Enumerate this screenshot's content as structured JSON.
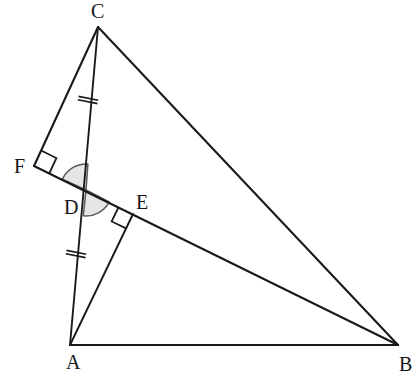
{
  "figure": {
    "kind": "geometry-diagram",
    "background_color": "#ffffff",
    "stroke_color": "#1a1a1a",
    "arc_fill_color": "#e6e6e6",
    "arc_stroke_color": "#5a5a5a",
    "width": 414,
    "height": 378
  },
  "points": {
    "A": {
      "label": "A",
      "x": 70,
      "y": 345,
      "label_x": 66,
      "label_y": 369
    },
    "B": {
      "label": "B",
      "x": 398,
      "y": 345,
      "label_x": 399,
      "label_y": 371
    },
    "C": {
      "label": "C",
      "x": 98,
      "y": 27,
      "label_x": 91,
      "label_y": 18
    },
    "D": {
      "label": "D",
      "x": 86,
      "y": 190,
      "label_x": 64,
      "label_y": 214
    },
    "E": {
      "label": "E",
      "x": 133,
      "y": 214,
      "label_x": 136,
      "label_y": 209
    },
    "F": {
      "label": "F",
      "x": 34,
      "y": 166,
      "label_x": 14,
      "label_y": 173
    }
  },
  "segments": [
    {
      "name": "AB",
      "from": "A",
      "to": "B"
    },
    {
      "name": "CB",
      "from": "C",
      "to": "B"
    },
    {
      "name": "CF",
      "from": "C",
      "to": "F"
    },
    {
      "name": "CA",
      "from": "C",
      "to": "A"
    },
    {
      "name": "FB",
      "from": "F",
      "to": "B"
    },
    {
      "name": "AE",
      "from": "A",
      "to": "E"
    }
  ],
  "right_angles": [
    {
      "name": "angle-at-F",
      "vertex": "F",
      "between": [
        "C",
        "B"
      ],
      "size": 17
    },
    {
      "name": "angle-at-E",
      "vertex": "E",
      "between": [
        "F",
        "A"
      ],
      "size": 16
    }
  ],
  "marked_angles": [
    {
      "name": "angle-FDC",
      "vertex": "D",
      "from": "F",
      "to": "C",
      "radius": 26,
      "shaded": true
    },
    {
      "name": "angle-ADE",
      "vertex": "D",
      "from": "E",
      "to": "A",
      "radius": 26,
      "shaded": true
    }
  ],
  "congruence_ticks": [
    {
      "name": "tick-CD",
      "segment": "CD",
      "x": 88,
      "y": 100,
      "count": 2,
      "angle_deg": 101.2
    },
    {
      "name": "tick-DA",
      "segment": "DA",
      "x": 76,
      "y": 254,
      "count": 2,
      "angle_deg": 101.2
    }
  ],
  "labels": {
    "A": "A",
    "B": "B",
    "C": "C",
    "D": "D",
    "E": "E",
    "F": "F"
  }
}
